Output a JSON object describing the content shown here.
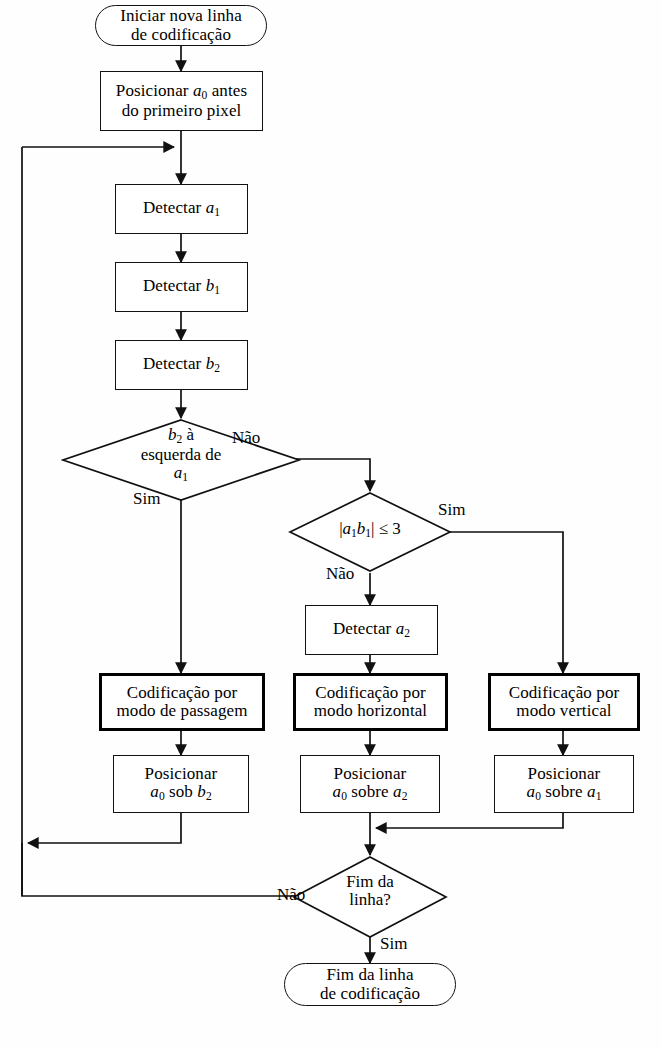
{
  "diagram": {
    "language": "pt-BR",
    "ink_color": "#111111",
    "background_color": "#fefefe"
  },
  "nodes": {
    "start": {
      "type": "terminator",
      "line1": "Iniciar nova linha",
      "line2": "de codificação"
    },
    "position_a0_first": {
      "type": "process",
      "line1_pre": "Posicionar ",
      "line1_var": "a",
      "line1_sub": "0",
      "line1_post": " antes",
      "line2": "do primeiro pixel"
    },
    "detect_a1": {
      "type": "process",
      "pre": "Detectar ",
      "var": "a",
      "sub": "1"
    },
    "detect_b1": {
      "type": "process",
      "pre": "Detectar ",
      "var": "b",
      "sub": "1"
    },
    "detect_b2": {
      "type": "process",
      "pre": "Detectar ",
      "var": "b",
      "sub": "2"
    },
    "decision_b2_left": {
      "type": "decision",
      "line1_var": "b",
      "line1_sub": "2",
      "line1_post": " à",
      "line2": "esquerda de",
      "line3_var": "a",
      "line3_sub": "1",
      "label_no": "Não",
      "label_yes": "Sim"
    },
    "decision_a1b1": {
      "type": "decision",
      "expr_open": "|",
      "expr_v1": "a",
      "expr_s1": "1",
      "expr_v2": "b",
      "expr_s2": "1",
      "expr_close": "|",
      "expr_rel": " ≤ 3",
      "label_yes": "Sim",
      "label_no": "Não"
    },
    "detect_a2": {
      "type": "process",
      "pre": "Detectar ",
      "var": "a",
      "sub": "2"
    },
    "mode_pass": {
      "type": "process-bold",
      "line1": "Codificação por",
      "line2": "modo de passagem"
    },
    "mode_horizontal": {
      "type": "process-bold",
      "line1": "Codificação por",
      "line2": "modo horizontal"
    },
    "mode_vertical": {
      "type": "process-bold",
      "line1": "Codificação por",
      "line2": "modo vertical"
    },
    "position_under_b2": {
      "type": "process",
      "line1": "Posicionar",
      "l2_v1": "a",
      "l2_s1": "0",
      "l2_mid": " sob ",
      "l2_v2": "b",
      "l2_s2": "2"
    },
    "position_over_a2": {
      "type": "process",
      "line1": "Posicionar",
      "l2_v1": "a",
      "l2_s1": "0",
      "l2_mid": " sobre ",
      "l2_v2": "a",
      "l2_s2": "2"
    },
    "position_over_a1": {
      "type": "process",
      "line1": "Posicionar",
      "l2_v1": "a",
      "l2_s1": "0",
      "l2_mid": " sobre ",
      "l2_v2": "a",
      "l2_s2": "1"
    },
    "decision_end_of_line": {
      "type": "decision",
      "line1": "Fim da",
      "line2": "linha?",
      "label_no": "Não",
      "label_yes": "Sim"
    },
    "end": {
      "type": "terminator",
      "line1": "Fim da linha",
      "line2": "de codificação"
    }
  },
  "edge_labels": {
    "d1_no": "Não",
    "d1_yes": "Sim",
    "d2_yes": "Sim",
    "d2_no": "Não",
    "d3_no": "Não",
    "d3_yes": "Sim"
  }
}
